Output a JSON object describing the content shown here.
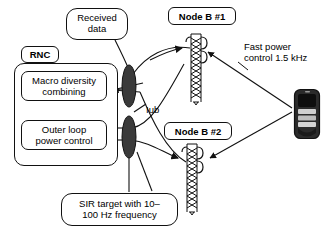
{
  "diagram": {
    "title_hidden": "",
    "callouts": [
      {
        "id": "received-data",
        "text": "Received data",
        "line1": "Received",
        "line2": "data"
      },
      {
        "id": "sir-target",
        "text": "SIR target with 10–100 Hz frequency",
        "line1": "SIR target with 10–",
        "line2": "100 Hz frequency"
      }
    ],
    "rnc": {
      "label": "RNC",
      "blocks": [
        {
          "id": "macro-diversity-combining",
          "line1": "Macro diversity",
          "line2": "combining"
        },
        {
          "id": "outer-loop-power-control",
          "line1": "Outer loop",
          "line2": "power control"
        }
      ]
    },
    "nodes": [
      {
        "id": "node-b-1",
        "label": "Node B #1"
      },
      {
        "id": "node-b-2",
        "label": "Node B #2"
      }
    ],
    "interface_label": "Iub",
    "fast_power": {
      "line1": "Fast power",
      "line2": "control 1.5 kHz"
    },
    "icons": {
      "antenna_ellipse": "antenna-ellipse-icon",
      "tower": "cell-tower-icon",
      "handset": "mobile-handset-icon"
    },
    "colors": {
      "stroke": "#111111",
      "ellipse_fill": "#3a3a3a",
      "background": "#ffffff",
      "phone_body": "#2b2b2b",
      "phone_screen": "#d8d8d8"
    }
  }
}
